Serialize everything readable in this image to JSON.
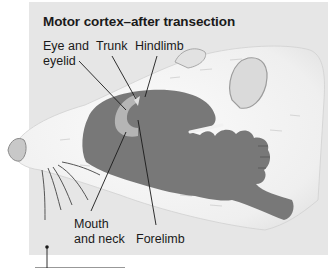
{
  "figure": {
    "title": "Motor cortex–after transection",
    "labels": {
      "eye_line1": "Eye and",
      "eye_line2": "eyelid",
      "trunk": "Trunk",
      "hindlimb": "Hindlimb",
      "mouth_line1": "Mouth",
      "mouth_line2": "and neck",
      "forelimb": "Forelimb"
    },
    "colors": {
      "background_panel": "#e6e6e6",
      "cortex_map": "#787878",
      "highlight_region": "#b4b4b4",
      "fur": "#f4f4f4",
      "text": "#1a1a1a"
    }
  }
}
